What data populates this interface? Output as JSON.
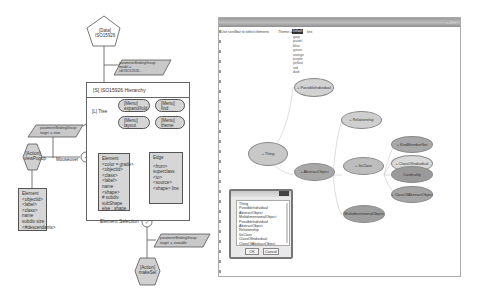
{
  "diagram": {
    "data_node": {
      "line1": "[Data]",
      "line2": "ISO15926"
    },
    "top_param": {
      "line1": "parameterBindingGroup:",
      "line2": "model =",
      "line3": "rdl:ISO15926..."
    },
    "hierarchy_panel": {
      "title": "[S] ISO15926 Hierarchy"
    },
    "tree_node": {
      "label": "[L] Tree"
    },
    "menus": [
      {
        "line1": "[Menu]",
        "line2": "expand/fold"
      },
      {
        "line1": "[Menu]",
        "line2": "find"
      },
      {
        "line1": "[Menu]",
        "line2": "layout"
      },
      {
        "line1": "[Menu]",
        "line2": "theme"
      }
    ],
    "element_box": {
      "lines": [
        "Element",
        "<color = grade>",
        "<objectid>",
        "<class>",
        "<label>",
        "name",
        "<shape>",
        "# subdiv",
        "subShape",
        "else : shape"
      ]
    },
    "edge_box": {
      "lines": [
        "Edge",
        "",
        "<from>",
        "superclass",
        "<to>",
        "<source>",
        "<shape> line"
      ]
    },
    "left_param": {
      "line1": "parameterBindingGroup:",
      "line2": "target := view"
    },
    "mouseover_label": "Mouseover",
    "action_left": {
      "line1": "[Action]",
      "line2": "viewPopup"
    },
    "popup_element_box": {
      "lines": [
        "Element",
        "<objectid>",
        "<label>",
        "<class>",
        "name",
        "subdiv size",
        "<#descendants>"
      ]
    },
    "selection_label": "Element Selection",
    "bottom_param": {
      "line1": "parameterBindingGroup:",
      "line2": "target := viewable"
    },
    "action_bottom": {
      "line1": "[Action]",
      "line2": "makeSel"
    }
  },
  "app_window": {
    "title": "ISO15926 Hierarchy",
    "hint": "Use scrollbar to select elements",
    "theme_label": "Theme =",
    "theme_value": "Default",
    "theme_extra": "line",
    "theme_options": [
      "gray",
      "pastel",
      "blue",
      "green",
      "orange",
      "purple",
      "yellow",
      "red",
      "dark"
    ],
    "nodes": [
      {
        "id": "thing",
        "label": "+ Thing",
        "shade": "#c8c8c8"
      },
      {
        "id": "possible_individual",
        "label": "+ PossibleIndividual",
        "shade": "#d2d2d2"
      },
      {
        "id": "abstract_object",
        "label": "+ AbstractObject",
        "shade": "#a8a8a8"
      },
      {
        "id": "relationship",
        "label": "+ Relationship",
        "shade": "#cfcfcf"
      },
      {
        "id": "class",
        "label": "+ ItsClass",
        "shade": "#bdbdbd"
      },
      {
        "id": "multidimensional_object",
        "label": "MultidimensionalObject",
        "shade": "#9e9e9e"
      },
      {
        "id": "kind_member",
        "label": "+ KindMemberSet",
        "shade": "#a8a8a8"
      },
      {
        "id": "class_of_individual",
        "label": "+ ClassOfIndividual",
        "shade": "#d9d9d9"
      },
      {
        "id": "cardinality",
        "label": "Cardinality",
        "shade": "#9a9a9a"
      },
      {
        "id": "class_of_abstract_object",
        "label": "+ ClassOfAbstractObject",
        "shade": "#a5a5a5"
      }
    ],
    "select_dialog": {
      "items": [
        "Thing",
        "PossibleIndividual",
        "AbstractObject",
        "MultidimensionalObject",
        "PossibleIndividual",
        "AbstractObject",
        "Relationship",
        "ItsClass",
        "ClassOfIndividual",
        "ClassOfAbstractObject"
      ],
      "ok_label": "OK",
      "cancel_label": "Cancel"
    }
  }
}
